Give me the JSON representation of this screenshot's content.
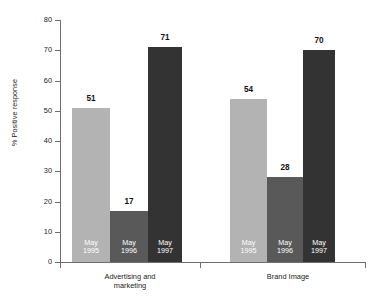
{
  "chart_data": {
    "type": "bar",
    "title": "",
    "xlabel": "",
    "ylabel": "% Positive response",
    "ylim": [
      0,
      80
    ],
    "ytick_step": 10,
    "ytick_labels": [
      "0",
      "10",
      "20",
      "30",
      "40",
      "50",
      "60",
      "70",
      "80"
    ],
    "grid": false,
    "legend_position": "none",
    "categories": [
      "Advertising and\nmarketing",
      "Brand Image"
    ],
    "series": [
      {
        "name": "May\n1995",
        "values": [
          51,
          54
        ],
        "color": "#b3b3b3"
      },
      {
        "name": "May\n1996",
        "values": [
          17,
          28
        ],
        "color": "#595959"
      },
      {
        "name": "May\n1997",
        "values": [
          71,
          70
        ],
        "color": "#333333"
      }
    ],
    "bars": [
      {
        "group": "Advertising and marketing",
        "series": "May 1995",
        "value": 51,
        "value_label": "51",
        "inner_label": "May\n1995",
        "color": "#b3b3b3"
      },
      {
        "group": "Advertising and marketing",
        "series": "May 1996",
        "value": 17,
        "value_label": "17",
        "inner_label": "May\n1996",
        "color": "#595959"
      },
      {
        "group": "Advertising and marketing",
        "series": "May 1997",
        "value": 71,
        "value_label": "71",
        "inner_label": "May\n1997",
        "color": "#333333"
      },
      {
        "group": "Brand Image",
        "series": "May 1995",
        "value": 54,
        "value_label": "54",
        "inner_label": "May\n1995",
        "color": "#b3b3b3"
      },
      {
        "group": "Brand Image",
        "series": "May 1996",
        "value": 28,
        "value_label": "28",
        "inner_label": "May\n1996",
        "color": "#595959"
      },
      {
        "group": "Brand Image",
        "series": "May 1997",
        "value": 70,
        "value_label": "70",
        "inner_label": "May\n1997",
        "color": "#333333"
      }
    ]
  },
  "axis": {
    "y_title": "% Positive response",
    "ticks": [
      "80",
      "70",
      "60",
      "50",
      "40",
      "30",
      "20",
      "10",
      "0"
    ]
  },
  "groups": [
    {
      "label": "Advertising and\nmarketing"
    },
    {
      "label": "Brand Image"
    }
  ],
  "bar_labels": {
    "b0_value": "51",
    "b0_inner": "May\n1995",
    "b1_value": "17",
    "b1_inner": "May\n1996",
    "b2_value": "71",
    "b2_inner": "May\n1997",
    "b3_value": "54",
    "b3_inner": "May\n1995",
    "b4_value": "28",
    "b4_inner": "May\n1996",
    "b5_value": "70",
    "b5_inner": "May\n1997"
  },
  "colors": {
    "series_1995": "#b3b3b3",
    "series_1996": "#595959",
    "series_1997": "#333333",
    "axis": "#6e6e6e",
    "background": "#ffffff"
  }
}
